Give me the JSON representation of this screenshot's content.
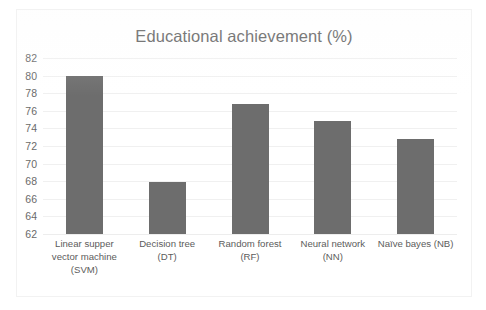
{
  "chart_data": {
    "type": "bar",
    "title": "Educational achievement (%)",
    "xlabel": "",
    "ylabel": "",
    "ylim": [
      62,
      82
    ],
    "ytick_step": 2,
    "yticks": [
      62,
      64,
      66,
      68,
      70,
      72,
      74,
      76,
      78,
      80,
      82
    ],
    "grid": true,
    "legend": false,
    "legend_position": "none",
    "categories": [
      "Linear supper vector machine (SVM)",
      "Decision tree (DT)",
      "Random forest (RF)",
      "Neural network (NN)",
      "Naïve bayes (NB)"
    ],
    "category_lines": [
      [
        "Linear supper",
        "vector machine",
        "(SVM)"
      ],
      [
        "Decision tree",
        "(DT)"
      ],
      [
        "Random forest",
        "(RF)"
      ],
      [
        "Neural network",
        "(NN)"
      ],
      [
        "Naïve bayes (NB)"
      ]
    ],
    "values": [
      80.0,
      67.9,
      76.8,
      74.8,
      72.8
    ],
    "bar_color": "#6d6d6d",
    "series": [
      {
        "name": "Educational achievement (%)",
        "values": [
          80.0,
          67.9,
          76.8,
          74.8,
          72.8
        ]
      }
    ]
  },
  "colors": {
    "bar": "#6d6d6d",
    "title_text": "#5e5e5e",
    "axis_text": "#6a6a6a",
    "gridline": "#f0f0f0",
    "frame_border": "#f2f2f2",
    "background": "#ffffff"
  }
}
